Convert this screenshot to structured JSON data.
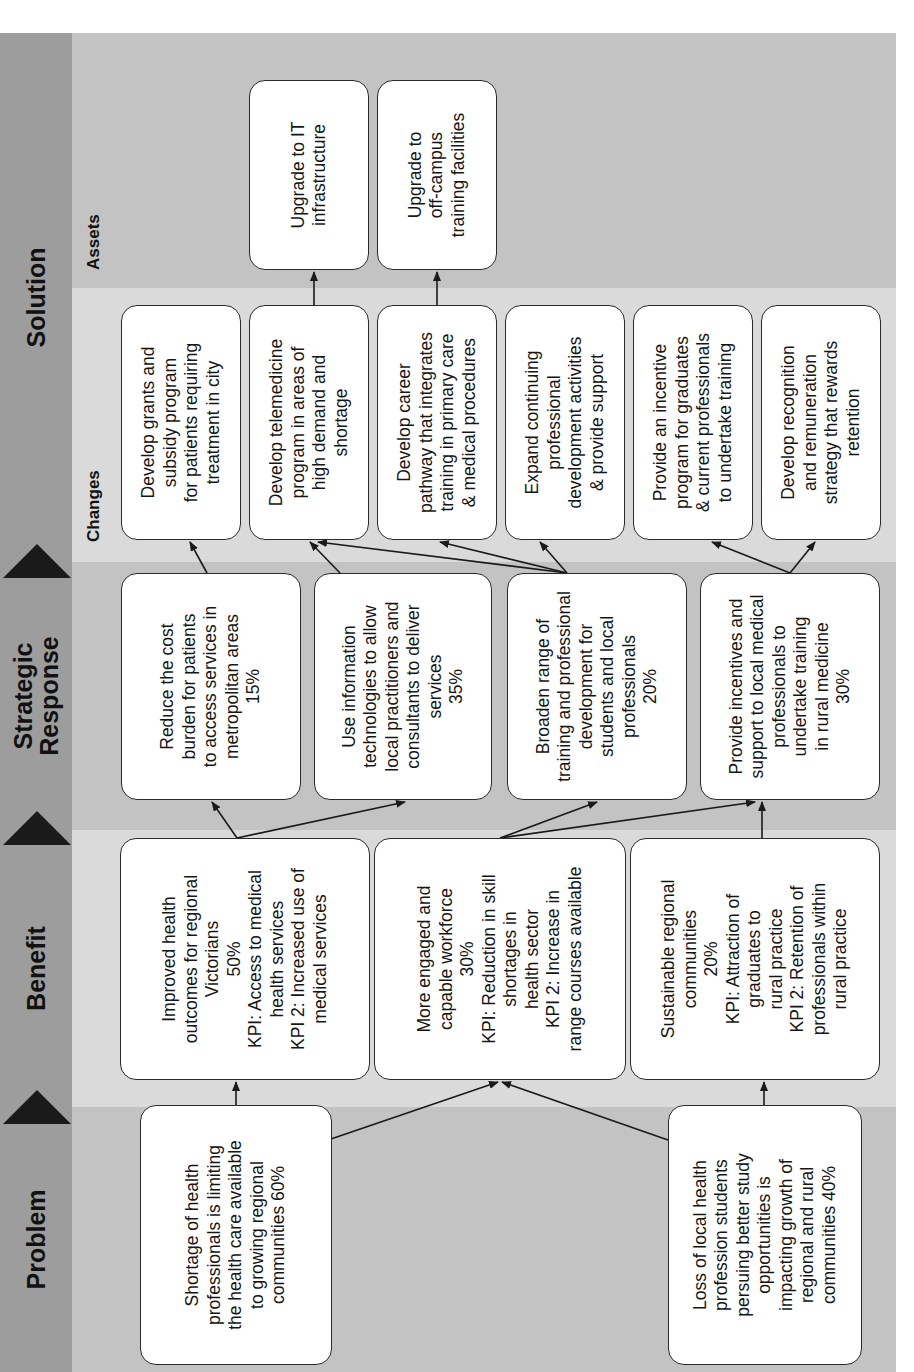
{
  "stages": {
    "problem": {
      "title": "Problem"
    },
    "benefit": {
      "title": "Benefit"
    },
    "strategic": {
      "title": "Strategic\nResponse"
    },
    "solution": {
      "title": "Solution",
      "changes_label": "Changes",
      "assets_label": "Assets"
    }
  },
  "problems": [
    {
      "text": "Shortage of health\nprofessionals is limiting\nthe health care available\nto growing regional\ncommunities 60%"
    },
    {
      "text": "Loss of local health\nprofession students\npersuing better study\nopportunities is\nimpacting growth of\nregional and rural\ncommunities 40%"
    }
  ],
  "benefits": [
    {
      "text": "Improved health\noutcomes for regional\nVictorians\n50%\nKPI: Access to medical\nhealth services\nKPI 2: Increased use of\nmedical services"
    },
    {
      "text": "More engaged and\ncapable workforce\n30%\nKPI: Reduction in skill\nshortages in\nhealth sector\nKPI 2: Increase in\nrange courses available"
    },
    {
      "text": "Sustainable regional\ncommunities\n20%\nKPI: Attraction of\ngraduates to\nrural practice\nKPI 2: Retention of\nprofessionals within\nrural practice"
    }
  ],
  "strategic_responses": [
    {
      "text": "Reduce the cost\nburden for patients\nto access services in\nmetropolitan areas\n15%"
    },
    {
      "text": "Use information\ntechnologies to allow\nlocal practitioners and\nconsultants to deliver\nservices\n35%"
    },
    {
      "text": "Broaden range of\ntraining and professional\ndevelopment for\nstudents and local\nprofessionals\n20%"
    },
    {
      "text": "Provide incentives and\nsupport to local medical\nprofessionals to\nundertake training\nin rural medicine\n30%"
    }
  ],
  "changes": [
    {
      "text": "Develop grants and\nsubsidy program\nfor patients requiring\ntreatment in city"
    },
    {
      "text": "Develop telemedicine\nprogram in areas of\nhigh demand and\nshortage"
    },
    {
      "text": "Develop career\npathway that integrates\ntraining in primary care\n& medical procedures"
    },
    {
      "text": "Expand continuing\nprofessional\ndevelopment activities\n& provide support"
    },
    {
      "text": "Provide an incentive\nprogram for graduates\n& current professionals\nto undertake training"
    },
    {
      "text": "Develop recognition\nand remuneration\nstrategy that rewards\nretention"
    }
  ],
  "assets": [
    {
      "text": "Upgrade to IT\ninfrastructure"
    },
    {
      "text": "Upgrade to\noff-campus\ntraining facilities"
    }
  ],
  "colors": {
    "header_strip": "#9d9d9d",
    "band_dark": "#c3c3c3",
    "band_light": "#dadada",
    "box_fill": "#ffffff",
    "box_border": "#2a2a2a",
    "triangle": "#1a1a1a"
  }
}
